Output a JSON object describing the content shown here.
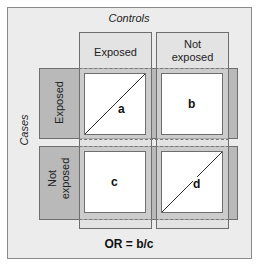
{
  "title_columns": "Controls",
  "title_rows": "Cases",
  "columns": [
    {
      "label": "Exposed"
    },
    {
      "label_line1": "Not",
      "label_line2": "exposed"
    }
  ],
  "rows": [
    {
      "label": "Exposed"
    },
    {
      "label_line1": "Not",
      "label_line2": "exposed"
    }
  ],
  "cells": [
    {
      "id": "a",
      "label": "a",
      "diagonal": true
    },
    {
      "id": "b",
      "label": "b",
      "diagonal": false
    },
    {
      "id": "c",
      "label": "c",
      "diagonal": false
    },
    {
      "id": "d",
      "label": "d",
      "diagonal": true
    }
  ],
  "formula": "OR = b/c",
  "colors": {
    "background": "#ececec",
    "row_header": "#b9b9b9",
    "cell": "#ffffff",
    "border": "#6e6e6e"
  }
}
